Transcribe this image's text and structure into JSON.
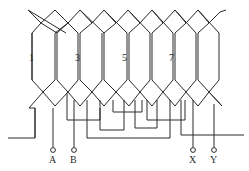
{
  "diagram": {
    "title": "",
    "type": "stator lap winding diagram",
    "coil_labels": [
      "1",
      "3",
      "5",
      "7"
    ],
    "terminals": [
      "A",
      "B",
      "X",
      "Y"
    ],
    "colors": {
      "line": "#2a2a2a",
      "background": "#ffffff"
    }
  }
}
